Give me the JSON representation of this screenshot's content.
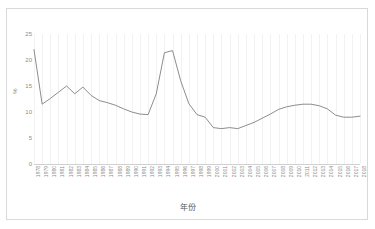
{
  "chart_data": {
    "type": "line",
    "title": "",
    "xlabel": "年份",
    "ylabel": "%",
    "ylim": [
      0,
      25
    ],
    "yticks": [
      0,
      5,
      10,
      15,
      20,
      25
    ],
    "grid": "vertical",
    "legend": "none",
    "line_color": "#808080",
    "categories": [
      "1978",
      "1979",
      "1980",
      "1981",
      "1982",
      "1983",
      "1984",
      "1985",
      "1986",
      "1987",
      "1988",
      "1989",
      "1990",
      "1991",
      "1992",
      "1993",
      "1994",
      "1995",
      "1996",
      "1997",
      "1998",
      "1999",
      "2000",
      "2001",
      "2002",
      "2003",
      "2004",
      "2005",
      "2006",
      "2007",
      "2008",
      "2009",
      "2010",
      "2011",
      "2012",
      "2013",
      "2014",
      "2015",
      "2016",
      "2017",
      "2018"
    ],
    "series": [
      {
        "name": "",
        "values": [
          22.0,
          11.5,
          12.6,
          13.8,
          15.0,
          13.5,
          14.8,
          13.2,
          12.2,
          11.8,
          11.3,
          10.6,
          10.0,
          9.6,
          9.5,
          13.5,
          21.4,
          21.8,
          16.0,
          11.6,
          9.5,
          9.0,
          7.0,
          6.8,
          7.0,
          6.8,
          7.4,
          8.0,
          8.8,
          9.6,
          10.5,
          11.0,
          11.3,
          11.5,
          11.5,
          11.2,
          10.6,
          9.4,
          9.0,
          9.0,
          9.2
        ]
      }
    ]
  }
}
